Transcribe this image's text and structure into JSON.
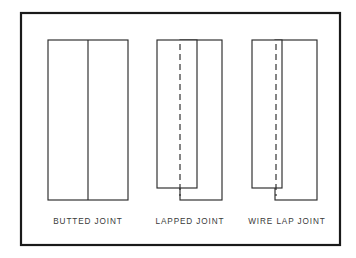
{
  "figure": {
    "background_color": "#ffffff",
    "line_color": "#2b2b2b",
    "frame_color": "#1a1a1a",
    "caption_color": "#3a3a3a"
  },
  "diagram_data": {
    "type": "technical-line-drawing",
    "subject": "sheet metal joint types",
    "panel_count": 3,
    "frame": {
      "x": 21,
      "y": 13,
      "width": 319,
      "height": 232
    },
    "panels": [
      {
        "id": "butted-joint",
        "label": "BUTTED JOINT",
        "label_x": 88,
        "label_y": 221,
        "description": "two plates meeting edge to edge with no overlap",
        "outer_rect": {
          "x": 48,
          "y": 40,
          "width": 80,
          "height": 160
        },
        "divider": {
          "x": 88,
          "y1": 40,
          "y2": 200
        },
        "has_centerline": false,
        "overlap_width": 0
      },
      {
        "id": "lapped-joint",
        "label": "LAPPED JOINT",
        "label_x": 190,
        "label_y": 221,
        "description": "two plates overlapping across a wide lap",
        "left_plate": {
          "x": 157,
          "y": 40,
          "width": 40,
          "height": 148
        },
        "right_plate": {
          "x": 180,
          "y": 40,
          "width": 42,
          "height": 160
        },
        "centerline": {
          "x": 180,
          "y1": 44,
          "y2": 196
        },
        "has_centerline": true,
        "overlap_width": 17
      },
      {
        "id": "wire-lap-joint",
        "label": "WIRE LAP JOINT",
        "label_x": 287,
        "label_y": 221,
        "description": "two plates overlapping a narrow seam enclosing a wire",
        "left_plate": {
          "x": 252,
          "y": 40,
          "width": 30,
          "height": 148
        },
        "right_plate": {
          "x": 275,
          "y": 40,
          "width": 42,
          "height": 160
        },
        "centerline": {
          "x": 276,
          "y1": 44,
          "y2": 196
        },
        "has_centerline": true,
        "overlap_width": 7
      }
    ]
  }
}
